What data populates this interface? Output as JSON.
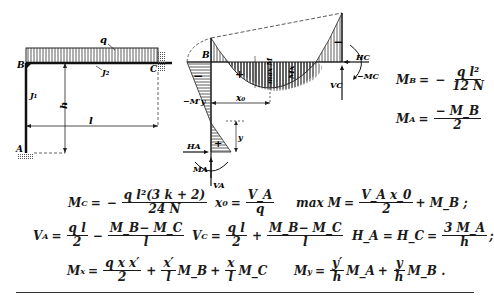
{
  "figure": {
    "frame_labels": {
      "joint_b": "B",
      "support_c": "C",
      "support_a": "A",
      "load": "q",
      "beam_inertia": "J2",
      "column_inertia": "J1",
      "height": "h",
      "span": "l"
    },
    "moment_diagram_labels": {
      "joint_b": "B",
      "minus_1": "−",
      "minus_2": "−",
      "plus_1": "+",
      "plus_2": "+",
      "max_m": "max M",
      "mx": "Mx",
      "my": "−My",
      "x0": "x0",
      "y_dim": "y",
      "ha": "HA",
      "ma": "MA",
      "va": "VA",
      "hc": "HC",
      "mc": "−MC",
      "vc": "VC"
    }
  },
  "equations": {
    "mb": {
      "lhs": "M",
      "lhs_sub": "B",
      "eq": "=",
      "sign": "−",
      "num": "q l²",
      "den": "12 N"
    },
    "ma": {
      "lhs": "M",
      "lhs_sub": "A",
      "eq": "=",
      "num": "− M_B",
      "den": "2"
    },
    "mc": {
      "lhs": "M",
      "lhs_sub": "C",
      "eq": "=",
      "sign": "−",
      "num": "q l²(3 k + 2)",
      "den": "24 N"
    },
    "x0": {
      "lhs": "x",
      "lhs_sub": "0",
      "eq": "=",
      "num": "V_A",
      "den": "q"
    },
    "maxm": {
      "lhs": "max M",
      "eq": "=",
      "num": "V_A x_0",
      "den": "2",
      "tail": "+ M_B ;"
    },
    "va": {
      "lhs": "V",
      "lhs_sub": "A",
      "eq": "=",
      "num1": "q l",
      "den1": "2",
      "op": "−",
      "num2": "M_B− M_C",
      "den2": "l"
    },
    "vc": {
      "lhs": "V",
      "lhs_sub": "C",
      "eq": "=",
      "num1": "q l",
      "den1": "2",
      "op": "+",
      "num2": "M_B− M_C",
      "den2": "l"
    },
    "hahc": {
      "lhs": "H_A = H_C",
      "eq": "=",
      "num": "3 M_A",
      "den": "h",
      "tail": ";"
    },
    "mx": {
      "lhs": "M",
      "lhs_sub": "x",
      "eq": "=",
      "num1": "q x x′",
      "den1": "2",
      "op1": "+",
      "num2": "x′",
      "den2": "l",
      "mid": "M_B",
      "op2": "+",
      "num3": "x",
      "den3": "l",
      "tail": "M_C"
    },
    "my": {
      "lhs": "M",
      "lhs_sub": "y",
      "eq": "=",
      "num1": "y′",
      "den1": "h",
      "mid": "M_A",
      "op": "+",
      "num2": "y",
      "den2": "h",
      "tail": "M_B ."
    }
  }
}
